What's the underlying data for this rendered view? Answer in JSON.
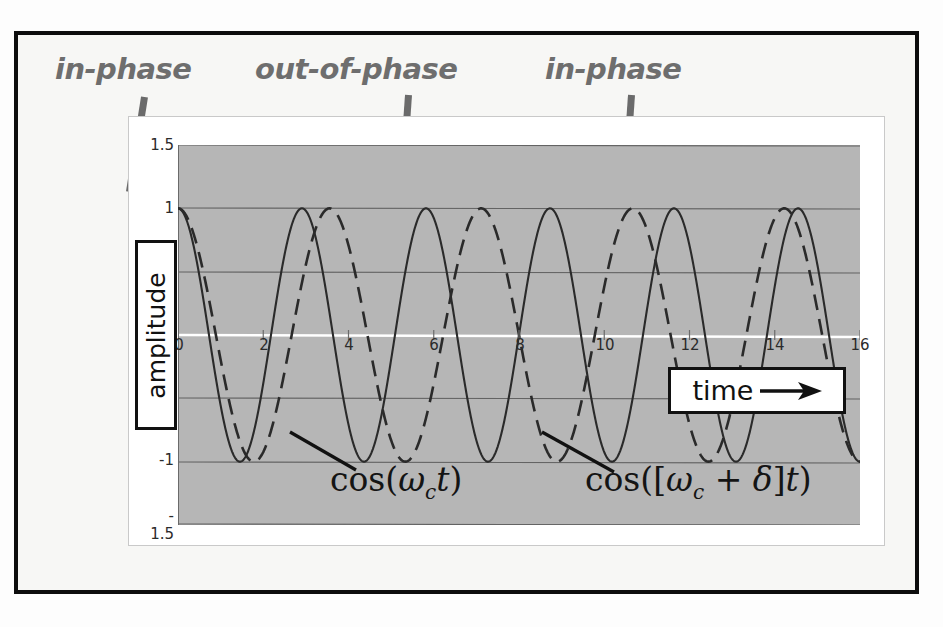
{
  "figure": {
    "callouts": [
      {
        "label": "in-phase"
      },
      {
        "label": "out-of-phase"
      },
      {
        "label": "in-phase"
      }
    ],
    "axis_label_y": "amplitude",
    "axis_label_x": "time",
    "x_arrow_icon": "right-arrow-icon",
    "equations": [
      {
        "prefix": "cos(",
        "omega": "ω",
        "sub": "c",
        "var": "t",
        "suffix": ")"
      },
      {
        "prefix": "cos([",
        "omega": "ω",
        "sub": "c",
        "plus": " + ",
        "delta": "δ",
        "close": "]",
        "var": "t",
        "suffix": ")"
      }
    ],
    "equation_text": [
      "cos(ωc t)",
      "cos([ωc + δ]t)"
    ],
    "colors": {
      "plot_background": "#b6b6b6",
      "frame": "#0d0d0d",
      "callout_text": "#6e6e6e",
      "pointer": "#6b6b6b",
      "gridline": "#5f5f5f",
      "zero_line": "#ffffff",
      "curve": "#2a2a2a"
    }
  },
  "chart_data": {
    "type": "line",
    "title": "",
    "xlabel": "time",
    "ylabel": "amplitude",
    "xlim": [
      0,
      16
    ],
    "ylim": [
      -1.5,
      1.5
    ],
    "xticks": [
      0,
      2,
      4,
      6,
      8,
      10,
      12,
      14,
      16
    ],
    "xtick_labels": [
      "0",
      "2",
      "4",
      "6",
      "8",
      "10",
      "12",
      "14",
      "16"
    ],
    "yticks": [
      1.5,
      1,
      0,
      -1,
      -1.5
    ],
    "ytick_labels": [
      "1.5",
      "1",
      "0",
      "-1",
      "-1.5"
    ],
    "grid": true,
    "legend": "none",
    "annotations": [
      {
        "text": "in-phase",
        "x": 0.5,
        "note": "curves aligned near t=0"
      },
      {
        "text": "out-of-phase",
        "x": 6.0,
        "note": "curves anti-aligned near t=6"
      },
      {
        "text": "in-phase",
        "x": 11.5,
        "note": "curves re-aligned near t=11.5"
      }
    ],
    "series": [
      {
        "name": "cos(ωc t)",
        "style": "solid",
        "formula": "cos(2*pi*t/2.909)",
        "period": 2.909,
        "cycles_in_range": 5.5,
        "phase": 0,
        "amplitude": 1
      },
      {
        "name": "cos([ωc + δ]t)",
        "style": "dashed",
        "formula": "cos(2*pi*t/3.556)",
        "period": 3.556,
        "cycles_in_range": 4.5,
        "phase": 0,
        "amplitude": 1
      }
    ]
  }
}
